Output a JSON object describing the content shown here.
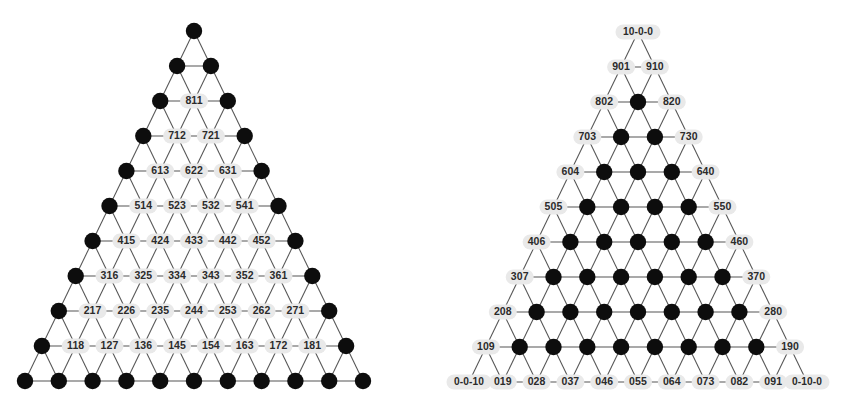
{
  "figure": {
    "type": "triangular-lattice-pair",
    "background": "#ffffff",
    "node_color": "#0d0d0d",
    "edge_color": "#555555",
    "label_bg_color": "#e9e9e9",
    "label_text_color": "#2b2b2b",
    "rows": 11,
    "row_spacing": 35,
    "col_spacing": 33.8
  },
  "panels": [
    {
      "id": "left-lattice",
      "name": "left-triangle-lattice",
      "apex": {
        "x": 194,
        "y": 31
      },
      "labeled_set": "interior",
      "rows": [
        {
          "index": 0,
          "labels": [
            null
          ]
        },
        {
          "index": 1,
          "labels": [
            null,
            null
          ]
        },
        {
          "index": 2,
          "labels": [
            null,
            "811",
            null
          ]
        },
        {
          "index": 3,
          "labels": [
            null,
            "712",
            "721",
            null
          ]
        },
        {
          "index": 4,
          "labels": [
            null,
            "613",
            "622",
            "631",
            null
          ]
        },
        {
          "index": 5,
          "labels": [
            null,
            "514",
            "523",
            "532",
            "541",
            null
          ]
        },
        {
          "index": 6,
          "labels": [
            null,
            "415",
            "424",
            "433",
            "442",
            "452",
            null
          ]
        },
        {
          "index": 7,
          "labels": [
            null,
            "316",
            "325",
            "334",
            "343",
            "352",
            "361",
            null
          ]
        },
        {
          "index": 8,
          "labels": [
            null,
            "217",
            "226",
            "235",
            "244",
            "253",
            "262",
            "271",
            null
          ]
        },
        {
          "index": 9,
          "labels": [
            null,
            "118",
            "127",
            "136",
            "145",
            "154",
            "163",
            "172",
            "181",
            null
          ]
        },
        {
          "index": 10,
          "labels": [
            null,
            null,
            null,
            null,
            null,
            null,
            null,
            null,
            null,
            null,
            null
          ]
        }
      ]
    },
    {
      "id": "right-lattice",
      "name": "right-triangle-lattice",
      "apex": {
        "x": 638,
        "y": 32
      },
      "labeled_set": "boundary",
      "rows": [
        {
          "index": 0,
          "labels": [
            "10-0-0"
          ]
        },
        {
          "index": 1,
          "labels": [
            "901",
            "910"
          ]
        },
        {
          "index": 2,
          "labels": [
            "802",
            null,
            "820"
          ]
        },
        {
          "index": 3,
          "labels": [
            "703",
            null,
            null,
            "730"
          ]
        },
        {
          "index": 4,
          "labels": [
            "604",
            null,
            null,
            null,
            "640"
          ]
        },
        {
          "index": 5,
          "labels": [
            "505",
            null,
            null,
            null,
            null,
            "550"
          ]
        },
        {
          "index": 6,
          "labels": [
            "406",
            null,
            null,
            null,
            null,
            null,
            "460"
          ]
        },
        {
          "index": 7,
          "labels": [
            "307",
            null,
            null,
            null,
            null,
            null,
            null,
            "370"
          ]
        },
        {
          "index": 8,
          "labels": [
            "208",
            null,
            null,
            null,
            null,
            null,
            null,
            null,
            "280"
          ]
        },
        {
          "index": 9,
          "labels": [
            "109",
            null,
            null,
            null,
            null,
            null,
            null,
            null,
            null,
            "190"
          ]
        },
        {
          "index": 10,
          "labels": [
            "0-0-10",
            "019",
            "028",
            "037",
            "046",
            "055",
            "064",
            "073",
            "082",
            "091",
            "0-10-0"
          ]
        }
      ]
    }
  ]
}
